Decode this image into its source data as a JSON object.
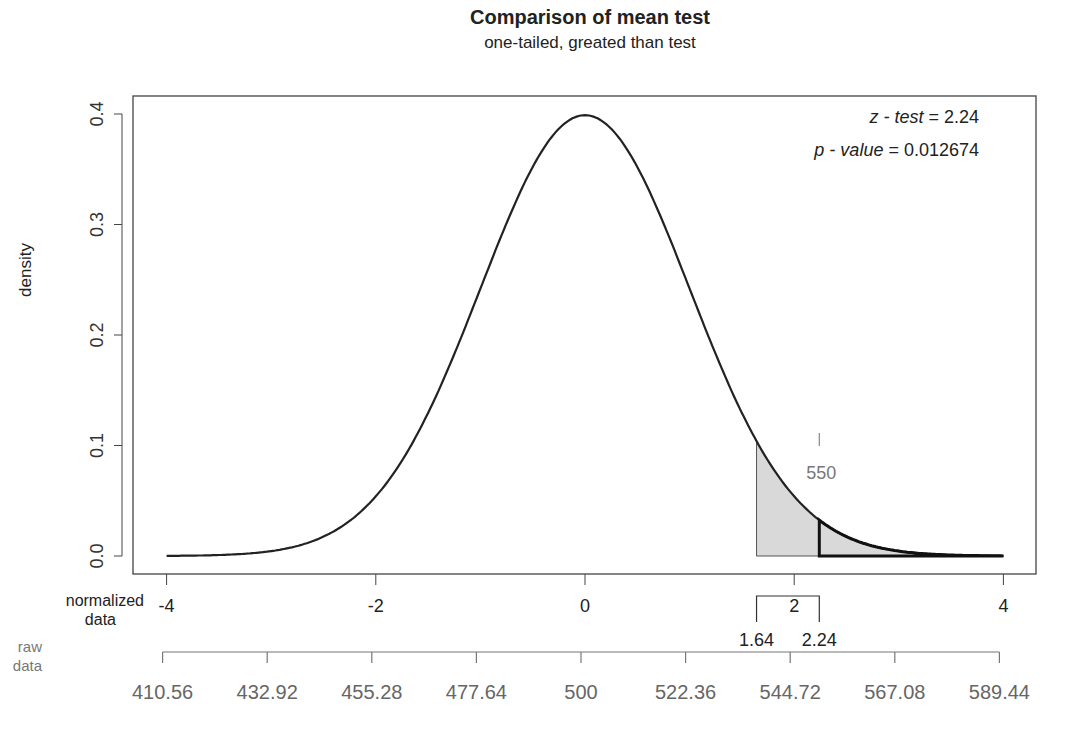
{
  "chart_data": {
    "type": "area",
    "title": "Comparison of mean test",
    "subtitle": "one-tailed, greated than test",
    "xlabel": "normalized data",
    "x2label": "raw data",
    "ylabel": "density",
    "xlim": [
      -4,
      4
    ],
    "ylim": [
      0,
      0.4
    ],
    "grid": false,
    "legend": null,
    "distribution": "standard normal",
    "x_ticks": [
      -4,
      -2,
      0,
      2,
      4
    ],
    "x_tick_labels": [
      "-4",
      "-2",
      "0",
      "2",
      "4"
    ],
    "y_ticks": [
      0.0,
      0.1,
      0.2,
      0.3,
      0.4
    ],
    "y_tick_labels": [
      "0.0",
      "0.1",
      "0.2",
      "0.3",
      "0.4"
    ],
    "raw_ticks": [
      410.56,
      432.92,
      455.28,
      477.64,
      500,
      522.36,
      544.72,
      567.08,
      589.44
    ],
    "raw_tick_labels": [
      "410.56",
      "432.92",
      "455.28",
      "477.64",
      "500",
      "522.36",
      "544.72",
      "567.08",
      "589.44"
    ],
    "critical_value": 1.64,
    "test_statistic": 2.24,
    "critical_region_shaded": {
      "from": 1.64,
      "to": 4,
      "fill": "#d9d9d9"
    },
    "p_value_region": {
      "from": 2.24,
      "to": 4
    },
    "raw_marker": {
      "value": 550,
      "label": "550",
      "z": 2.24
    },
    "annotations": {
      "z_test": {
        "label": "z - test",
        "value": "2.24"
      },
      "p_value": {
        "label": "p - value",
        "value": "0.012674"
      }
    },
    "curve": {
      "x": [
        -4,
        -3.5,
        -3,
        -2.5,
        -2,
        -1.5,
        -1,
        -0.5,
        0,
        0.5,
        1,
        1.5,
        2,
        2.5,
        3,
        3.5,
        4
      ],
      "y": [
        0.0001,
        0.0009,
        0.0044,
        0.0175,
        0.054,
        0.1295,
        0.242,
        0.3521,
        0.3989,
        0.3521,
        0.242,
        0.1295,
        0.054,
        0.0175,
        0.0044,
        0.0009,
        0.0001
      ]
    }
  },
  "labels": {
    "title": "Comparison of mean test",
    "subtitle": "one-tailed, greated than test",
    "ylabel": "density",
    "normalized_line1": "normalized",
    "normalized_line2": "data",
    "raw_line1": "raw",
    "raw_line2": "data",
    "z_test_label": "z - test",
    "z_test_value": " = 2.24",
    "p_value_label": "p - value",
    "p_value_value": " = 0.012674",
    "crit_label": "1.64",
    "stat_label": "2.24",
    "marker_label": "550"
  },
  "colors": {
    "curve": "#222222",
    "shade": "#d9d9d9",
    "axis": "#444444",
    "raw_axis": "#777777",
    "raw_text": "#666666"
  }
}
